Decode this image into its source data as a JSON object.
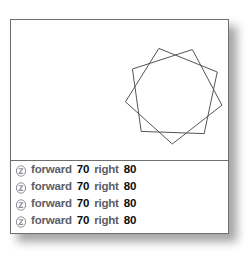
{
  "window": {
    "name": "turtle-graphics-window",
    "background_color": "#ffffff",
    "border_color": "#6e6e6e"
  },
  "canvas": {
    "name": "turtle-canvas",
    "background_color": "#ffffff",
    "stroke_color": "#555555",
    "drawing": {
      "shape_name": "nine-pointed-star-polygon",
      "points": 9,
      "step": 2,
      "center_x": 173,
      "center_y": 95,
      "radius": 49,
      "start_angle_deg": -108
    }
  },
  "commands": {
    "icon_name": "turtle-icon",
    "rows": [
      {
        "icon": "turtle-icon",
        "action_label": "forward",
        "action_value": "70",
        "turn_label": "right",
        "turn_value": "80"
      },
      {
        "icon": "turtle-icon",
        "action_label": "forward",
        "action_value": "70",
        "turn_label": "right",
        "turn_value": "80"
      },
      {
        "icon": "turtle-icon",
        "action_label": "forward",
        "action_value": "70",
        "turn_label": "right",
        "turn_value": "80"
      },
      {
        "icon": "turtle-icon",
        "action_label": "forward",
        "action_value": "70",
        "turn_label": "right",
        "turn_value": "80"
      }
    ]
  },
  "colors": {
    "keyword": "#5b6068",
    "number": "#0b0b0b",
    "line": "#555555",
    "border": "#6e6e6e"
  }
}
